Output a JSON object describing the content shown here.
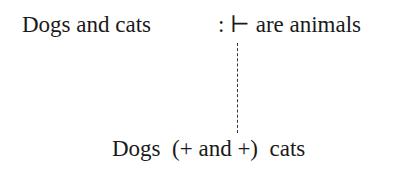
{
  "diagram": {
    "top_left": "Dogs and cats",
    "top_right": ": ⊢ are animals",
    "bottom": "Dogs  (+ and +)  cats",
    "connector": "dashed-vertical-line"
  }
}
